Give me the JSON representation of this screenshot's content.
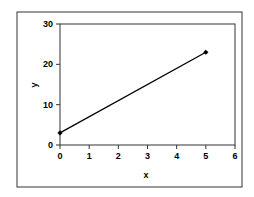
{
  "chart_data": {
    "type": "line",
    "title": "",
    "xlabel": "x",
    "ylabel": "y",
    "xlim": [
      0,
      6
    ],
    "ylim": [
      0,
      30
    ],
    "x_ticks": [
      0,
      1,
      2,
      3,
      4,
      5,
      6
    ],
    "y_ticks": [
      0,
      10,
      20,
      30
    ],
    "grid": false,
    "legend": null,
    "series": [
      {
        "name": "series1",
        "x": [
          0,
          5
        ],
        "y": [
          3,
          23
        ],
        "marker": "diamond",
        "color": "#000000"
      }
    ]
  },
  "colors": {
    "line": "#000000",
    "frame": "#333333",
    "background": "#ffffff"
  }
}
